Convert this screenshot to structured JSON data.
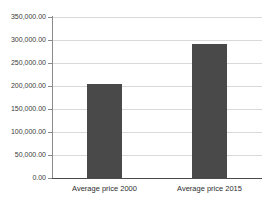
{
  "chart_data": {
    "type": "bar",
    "title": "",
    "subtitle": "",
    "xlabel": "",
    "ylabel": "",
    "categories": [
      "Average price 2000",
      "Average price 2015"
    ],
    "values": [
      205000,
      291000
    ],
    "series": [
      {
        "name": "",
        "values": [
          205000,
          291000
        ]
      }
    ],
    "ylim": [
      0,
      350000
    ],
    "yticks": [
      0,
      50000,
      100000,
      150000,
      200000,
      250000,
      300000,
      350000
    ],
    "ytick_labels": [
      "0.00",
      "50,000.00",
      "100,000.00",
      "150,000.00",
      "200,000.00",
      "250,000.00",
      "300,000.00",
      "350,000.00"
    ],
    "grid": true,
    "legend": false,
    "legend_position": "none",
    "annotations": [],
    "colors": {
      "bar": "#494949",
      "gridline": "#d9d9d9",
      "axis": "#4a4a4a",
      "axis_y": "#8a8a8a",
      "tick_label": "#3c3c3c",
      "category_label": "#2e2e2e",
      "background": "#ffffff"
    }
  }
}
